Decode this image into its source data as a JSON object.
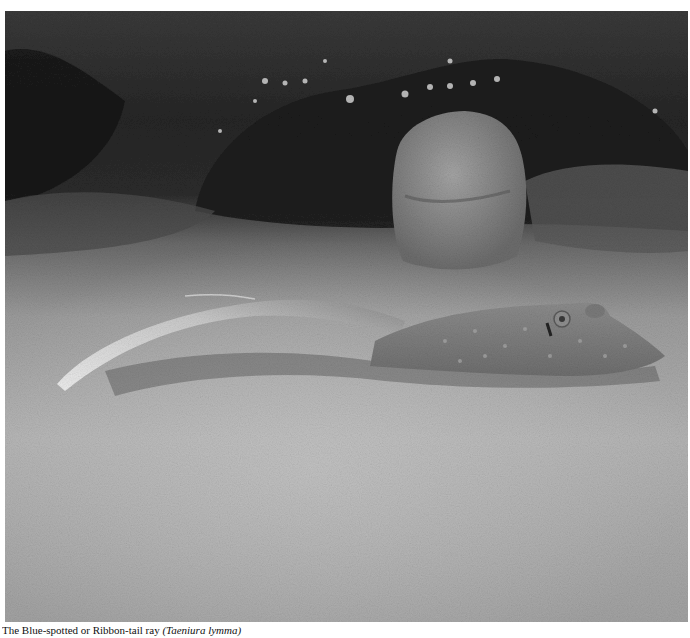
{
  "figure": {
    "subjects": [
      "ribbontail-stingray",
      "coral-rock",
      "sandy-seafloor",
      "reef-background"
    ],
    "tone": "monochrome",
    "colors": {
      "background_dark": "#1a1a1a",
      "sand_light": "#b9b9b9",
      "sand_mid": "#9a9a9a",
      "ray_body": "#7d7d7d",
      "tail_highlight": "#e2e2e2",
      "rock": "#8a8a8a"
    }
  },
  "caption": {
    "text": "The Blue-spotted or Ribbon-tail ray",
    "species": "(Taeniura lymma)",
    "truncated": true
  }
}
